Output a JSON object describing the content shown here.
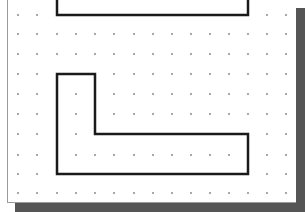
{
  "canvas": {
    "background": "#ffffff",
    "border_color": "#9a9a9a",
    "shadow_color": "#555555"
  },
  "grid": {
    "dot_color": "#8a8a8a",
    "columns_x": [
      18,
      37,
      57,
      76,
      95,
      114,
      134,
      153,
      172,
      191,
      210,
      229,
      248,
      267,
      286
    ],
    "rows_y": [
      15,
      34,
      54,
      74,
      94,
      114,
      134,
      155,
      174,
      193
    ]
  },
  "shapes": {
    "stroke_color": "#1a1a1a",
    "stroke_width": 2.5,
    "top_shape_points": "57,0 57,15 248,15 248,0",
    "l_shape_points": "57,74 95,74 95,134 248,134 248,174 57,174"
  }
}
